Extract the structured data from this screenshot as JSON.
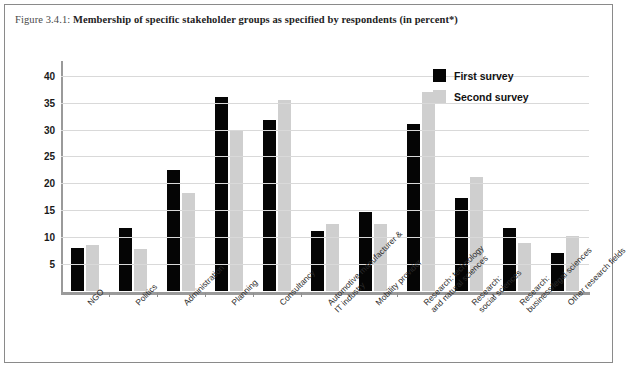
{
  "figure": {
    "caption_number": "Figure 3.4.1:",
    "caption_text": "Membership of specific stakeholder groups as specified by respondents (in percent*)"
  },
  "legend": {
    "position": "top-right",
    "items": [
      {
        "label": "First survey",
        "color": "#050505",
        "name": "first-survey"
      },
      {
        "label": "Second survey",
        "color": "#cfcfcf",
        "name": "second-survey"
      }
    ]
  },
  "chart_data": {
    "type": "bar",
    "title": "Membership of specific stakeholder groups as specified by respondents (in percent*)",
    "xlabel": "",
    "ylabel": "",
    "ylim": [
      0,
      42
    ],
    "yticks": [
      5,
      10,
      15,
      20,
      25,
      30,
      35,
      40
    ],
    "grid": true,
    "legend_position": "top-right",
    "categories": [
      "NGO",
      "Politics",
      "Administration",
      "Planning",
      "Consultancy",
      "Automotive manufacturer &\nIT industry",
      "Mobility provider",
      "Research: technology\nand natural sciences",
      "Research:\nsocial sciences",
      "Research:\nbusiness/legal sciences",
      "Other research fields"
    ],
    "series": [
      {
        "name": "First survey",
        "color": "#050505",
        "values": [
          8,
          11.8,
          22.5,
          36,
          31.8,
          11.2,
          14.6,
          31,
          17.2,
          11.7,
          7
        ]
      },
      {
        "name": "Second survey",
        "color": "#cfcfcf",
        "values": [
          8.5,
          7.8,
          18.3,
          30,
          35.5,
          12.5,
          12.5,
          37,
          21.2,
          9,
          10.2
        ]
      }
    ]
  }
}
